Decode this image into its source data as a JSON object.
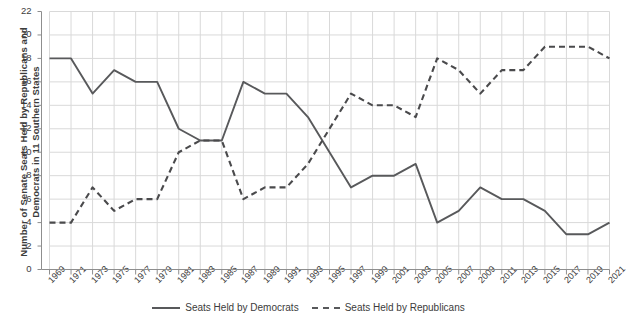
{
  "chart_data": {
    "type": "line",
    "title": "",
    "xlabel": "",
    "ylabel": "Number of Senate Seats Held by Republicans and\nDemocrats in 11 Southern States",
    "ylim": [
      0,
      22
    ],
    "ytick_step": 2,
    "grid": true,
    "legend_position": "bottom-center",
    "categories": [
      "1969",
      "1971",
      "1973",
      "1975",
      "1977",
      "1979",
      "1981",
      "1983",
      "1985",
      "1987",
      "1989",
      "1991",
      "1993",
      "1995",
      "1997",
      "1999",
      "2001",
      "2003",
      "2005",
      "2007",
      "2009",
      "2011",
      "2013",
      "2015",
      "2017",
      "2019",
      "2021"
    ],
    "yticks": [
      "0",
      "2",
      "4",
      "6",
      "8",
      "10",
      "12",
      "14",
      "16",
      "18",
      "20",
      "22"
    ],
    "series": [
      {
        "name": "Seats Held by Democrats",
        "style": "solid",
        "color": "#58595b",
        "values": [
          18,
          18,
          15,
          17,
          16,
          16,
          12,
          11,
          11,
          16,
          15,
          15,
          13,
          10,
          7,
          8,
          8,
          9,
          4,
          5,
          7,
          6,
          6,
          5,
          3,
          3,
          4
        ]
      },
      {
        "name": "Seats Held by Republicans",
        "style": "dashed",
        "color": "#4a4a4c",
        "values": [
          4,
          4,
          7,
          5,
          6,
          6,
          10,
          11,
          11,
          6,
          7,
          7,
          9,
          12,
          15,
          14,
          14,
          13,
          18,
          17,
          15,
          17,
          17,
          19,
          19,
          19,
          18
        ]
      }
    ]
  },
  "legend": {
    "items": [
      {
        "label": "Seats Held by Democrats"
      },
      {
        "label": "Seats Held by Republicans"
      }
    ]
  }
}
